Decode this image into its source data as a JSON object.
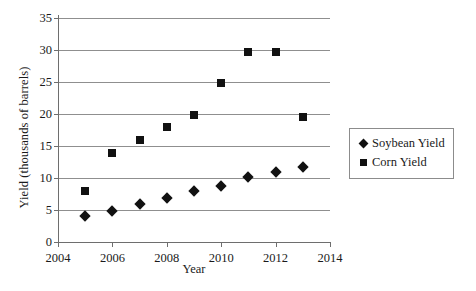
{
  "chart_data": {
    "type": "scatter",
    "title": "",
    "xlabel": "Year",
    "ylabel": "Yield (thousands of barrels)",
    "x": [
      2005,
      2006,
      2007,
      2008,
      2009,
      2010,
      2011,
      2012,
      2013
    ],
    "xlim": [
      2004,
      2014
    ],
    "ylim": [
      0,
      35
    ],
    "xticks": [
      "2004",
      "2006",
      "2008",
      "2010",
      "2012",
      "2014"
    ],
    "yticks": [
      "0",
      "5",
      "10",
      "15",
      "20",
      "25",
      "30",
      "35"
    ],
    "grid": "horizontal",
    "legend_position": "right",
    "series": [
      {
        "name": "Soybean Yield",
        "marker": "diamond",
        "color": "#111111",
        "values": [
          4.1,
          4.9,
          6.0,
          6.9,
          7.9,
          8.8,
          10.2,
          10.9,
          11.7
        ]
      },
      {
        "name": "Corn Yield",
        "marker": "square",
        "color": "#111111",
        "values": [
          7.9,
          13.9,
          15.9,
          18.0,
          19.8,
          24.8,
          29.7,
          29.7,
          19.6
        ]
      }
    ]
  },
  "legend": {
    "entries": [
      {
        "label": "Soybean Yield",
        "marker": "diamond"
      },
      {
        "label": "Corn Yield",
        "marker": "square"
      }
    ]
  }
}
